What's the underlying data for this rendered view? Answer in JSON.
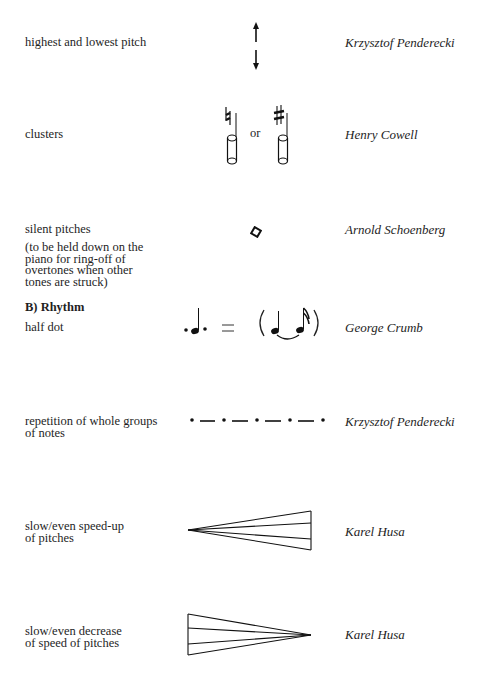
{
  "sections": {
    "rhythm_heading": "B)  Rhythm"
  },
  "entries": [
    {
      "description": "highest and lowest pitch",
      "symbol": "up-arrow-and-down-arrow",
      "composer": "Krzysztof Penderecki"
    },
    {
      "description": "clusters",
      "symbol": "natural-cluster-or-sharp-cluster",
      "symbol_connector": "or",
      "composer": "Henry Cowell"
    },
    {
      "description": "silent pitches",
      "note": "(to be held down on the\npiano for ring-off of\novertones when other\ntones are struck)",
      "symbol": "diamond-notehead",
      "composer": "Arnold Schoenberg"
    },
    {
      "description": "half dot",
      "symbol": "half-dotted-quarter-equals-tied-quarter-and-sixteenth",
      "symbol_equals": "=",
      "composer": "George Crumb"
    },
    {
      "description": "repetition of whole groups\nof notes",
      "description_lines": [
        "repetition of whole groups",
        "of notes"
      ],
      "symbol": "dot-dash-repetition",
      "composer": "Krzysztof Penderecki"
    },
    {
      "description_lines": [
        "slow/even speed-up",
        "of pitches"
      ],
      "symbol": "fan-widening-right",
      "composer": "Karel Husa"
    },
    {
      "description_lines": [
        "slow/even decrease",
        "of speed of pitches"
      ],
      "symbol": "fan-narrowing-right",
      "composer": "Karel Husa"
    }
  ]
}
